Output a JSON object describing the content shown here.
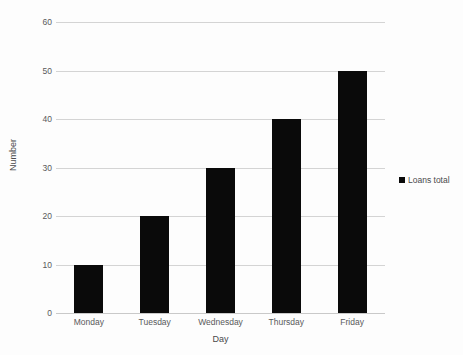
{
  "chart_data": {
    "type": "bar",
    "title": "",
    "categories": [
      "Monday",
      "Tuesday",
      "Wednesday",
      "Thursday",
      "Friday"
    ],
    "values": [
      10,
      20,
      30,
      40,
      50
    ],
    "series": [
      {
        "name": "Loans total",
        "values": [
          10,
          20,
          30,
          40,
          50
        ]
      }
    ],
    "xlabel": "Day",
    "ylabel": "Number",
    "ylim": [
      0,
      60
    ],
    "ytick_values": [
      0,
      10,
      20,
      30,
      40,
      50,
      60
    ],
    "ytick_labels": [
      "0",
      "10",
      "20",
      "30",
      "40",
      "50",
      "60"
    ],
    "grid": "horizontal",
    "legend_position": "right",
    "bar_color": "#0a0a0a",
    "gridline_color": "#d4d4d4",
    "background_color": "#fdfdfd"
  },
  "legend": {
    "entries": [
      {
        "label": "Loans total",
        "color": "#0a0a0a"
      }
    ]
  }
}
